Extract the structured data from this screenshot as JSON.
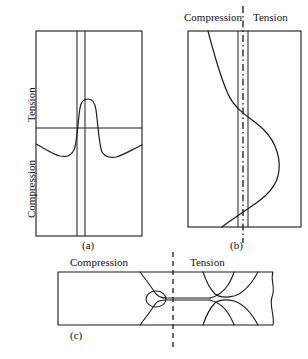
{
  "figure": {
    "panels": [
      {
        "id": "a",
        "caption": "(a)",
        "axis_labels": {
          "upper": "Tension",
          "lower": "Compression"
        },
        "description": "Rectangular cross-section with narrow central weld zone; stress curve peaks in tension at the weld and dips into compression on both sides",
        "curve_type": "residual-stress-profile"
      },
      {
        "id": "b",
        "caption": "(b)",
        "headers": {
          "left": "Compression",
          "right": "Tension"
        },
        "description": "Vertical section with dash-dot centerline; S-shaped stress curve crossing from compression to tension",
        "curve_type": "s-curve"
      },
      {
        "id": "c",
        "caption": "(c)",
        "headers": {
          "left": "Compression",
          "right": "Tension"
        },
        "description": "Horizontal bar with necked flow lines and dashed vertical centerline",
        "curve_type": "flow-lines"
      }
    ]
  },
  "colors": {
    "line": "#1a1a1a",
    "background": "#ffffff",
    "text": "#111111"
  }
}
